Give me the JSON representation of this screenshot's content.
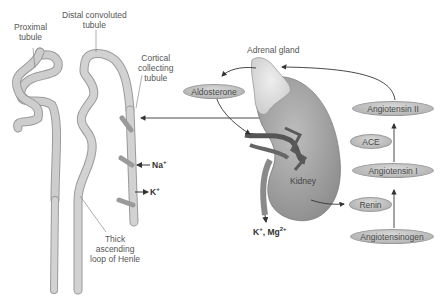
{
  "labels": {
    "proximal_tubule": "Proximal\ntubule",
    "proximal_line1": "Proximal",
    "proximal_line2": "tubule",
    "distal_line1": "Distal convoluted",
    "distal_line2": "tubule",
    "cortical_line1": "Cortical",
    "cortical_line2": "collecting",
    "cortical_line3": "tubule",
    "thick_line1": "Thick",
    "thick_line2": "ascending",
    "thick_line3": "loop of Henle",
    "adrenal_gland": "Adrenal gland",
    "kidney": "Kidney"
  },
  "ions": {
    "na": "Na",
    "na_sup": "+",
    "k": "K",
    "k_sup": "+",
    "excreted_k": "K",
    "excreted_k_sup": "+",
    "excreted_sep": ", Mg",
    "excreted_mg_sup": "2+"
  },
  "nodes": {
    "aldosterone": "Aldosterone",
    "angiotensin_ii": "Angiotensin II",
    "ace": "ACE",
    "angiotensin_i": "Angiotensin I",
    "renin": "Renin",
    "angiotensinogen": "Angiotensinogen"
  },
  "colors": {
    "tubule_fill": "#c8c8c8",
    "tubule_stroke": "#9a9a9a",
    "kidney_fill": "#a8a8a8",
    "adrenal_fill": "#dcdcdc",
    "arrow": "#333333",
    "pill_fill": "#bdbdbd"
  }
}
